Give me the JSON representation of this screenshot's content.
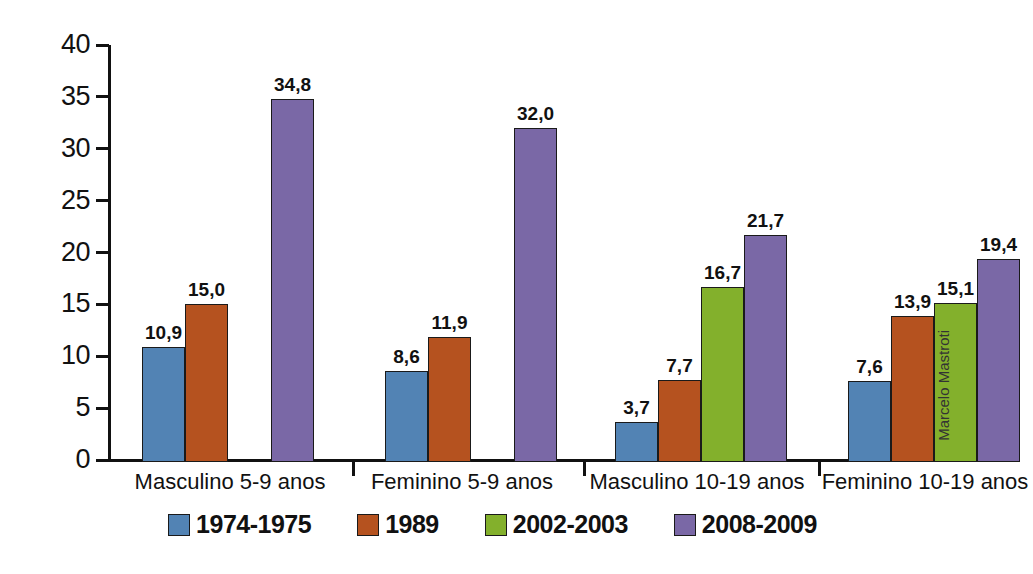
{
  "chart_data": {
    "type": "bar",
    "title": "",
    "subtitle": "",
    "xlabel": "",
    "ylabel": "",
    "ylim": [
      0,
      40
    ],
    "ytick_step": 5,
    "yticks": [
      "40",
      "35",
      "30",
      "25",
      "20",
      "15",
      "10",
      "5",
      "0"
    ],
    "grid": false,
    "legend_position": "bottom",
    "decimal_separator": ",",
    "categories": [
      "Masculino 5-9 anos",
      "Feminino 5-9 anos",
      "Masculino 10-19 anos",
      "Feminino 10-19 anos"
    ],
    "series": [
      {
        "name": "1974-1975",
        "color": "#5283b4",
        "values": [
          10.9,
          8.6,
          3.7,
          7.6
        ],
        "labels": [
          "10,9",
          "8,6",
          "3,7",
          "7,6"
        ]
      },
      {
        "name": "1989",
        "color": "#b5521f",
        "values": [
          15.0,
          11.9,
          7.7,
          13.9
        ],
        "labels": [
          "15,0",
          "11,9",
          "7,7",
          "13,9"
        ]
      },
      {
        "name": "2002-2003",
        "color": "#83b02c",
        "values": [
          null,
          null,
          16.7,
          15.1
        ],
        "labels": [
          "",
          "",
          "16,7",
          "15,1"
        ]
      },
      {
        "name": "2008-2009",
        "color": "#7a68a6",
        "values": [
          34.8,
          32.0,
          21.7,
          19.4
        ],
        "labels": [
          "34,8",
          "32,0",
          "21,7",
          "19,4"
        ]
      }
    ]
  },
  "legend": {
    "items": [
      {
        "label": "1974-1975",
        "color": "#5283b4"
      },
      {
        "label": "1989",
        "color": "#b5521f"
      },
      {
        "label": "2002-2003",
        "color": "#83b02c"
      },
      {
        "label": "2008-2009",
        "color": "#7a68a6"
      }
    ]
  },
  "credit": {
    "text": "Marcelo Mastroti"
  },
  "axis": {
    "line_color": "#111111",
    "background": "#ffffff"
  }
}
